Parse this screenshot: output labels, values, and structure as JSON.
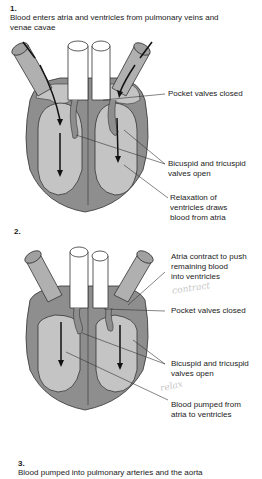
{
  "stages": [
    {
      "number": "1.",
      "caption_line1": "Blood enters atria and ventricles from pulmonary veins and",
      "caption_line2": "venae cavae",
      "labels": {
        "pocket": "Pocket valves closed",
        "bicuspid_1": "Bicuspid and tricuspid",
        "bicuspid_2": "valves open",
        "relax_1": "Relaxation of",
        "relax_2": "ventricles draws",
        "relax_3": "blood from atria"
      }
    },
    {
      "number": "2.",
      "labels": {
        "atria_1": "Atria contract to push",
        "atria_2": "remaining blood",
        "atria_3": "into ventricles",
        "pocket": "Pocket valves closed",
        "bicuspid_1": "Bicuspid and tricuspid",
        "bicuspid_2": "valves open",
        "pumped_1": "Blood pumped from",
        "pumped_2": "atria to ventricles"
      },
      "handwriting": [
        "contract",
        "relax"
      ]
    },
    {
      "number": "3.",
      "caption": "Blood pumped into pulmonary arteries and the aorta"
    }
  ],
  "colors": {
    "heart_wall": "#8e8e8e",
    "chamber": "#c4c4c4",
    "vessel": "#b0b0b0",
    "artery": "#ffffff",
    "outline": "#333333"
  }
}
